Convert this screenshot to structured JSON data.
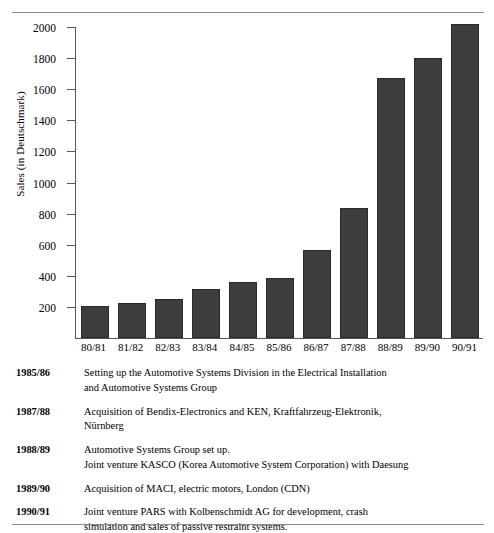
{
  "chart_data": {
    "type": "bar",
    "title": "",
    "xlabel": "",
    "ylabel": "Sales (in Deutschmark)",
    "categories": [
      "80/81",
      "81/82",
      "82/83",
      "83/84",
      "84/85",
      "85/86",
      "86/87",
      "87/88",
      "88/89",
      "89/90",
      "90/91"
    ],
    "values": [
      195,
      210,
      240,
      300,
      350,
      375,
      555,
      825,
      1660,
      1785,
      2005
    ],
    "ylim": [
      0,
      2000
    ],
    "yticks": [
      200,
      400,
      600,
      800,
      1000,
      1200,
      1400,
      1600,
      1800,
      2000
    ],
    "grid": false,
    "legend": "none",
    "bar_color": "#3d3d3d"
  },
  "notes": [
    {
      "year": "1985/86",
      "lines": [
        "Setting up the Automotive Systems Division in the Electrical Installation",
        "and Automotive Systems Group"
      ]
    },
    {
      "year": "1987/88",
      "lines": [
        "Acquisition of Bendix-Electronics and KEN, Kraftfahrzeug-Elektronik,",
        "Nürnberg"
      ]
    },
    {
      "year": "1988/89",
      "lines": [
        "Automotive Systems Group set up.",
        "Joint venture KASCO (Korea Automotive System Corporation) with Daesung"
      ]
    },
    {
      "year": "1989/90",
      "lines": [
        "Acquisition of MACI, electric motors, London (CDN)"
      ]
    },
    {
      "year": "1990/91",
      "lines": [
        "Joint venture PARS with Kolbenschmidt AG for development, crash",
        "simulation and sales of passive restraint systems."
      ]
    }
  ]
}
